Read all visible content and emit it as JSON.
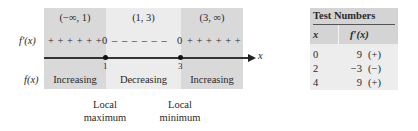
{
  "sign_chart": {
    "intervals": [
      {
        "label": "(−∞, 1)",
        "sign": "+ + + + + +",
        "behavior": "Increasing"
      },
      {
        "label": "(1, 3)",
        "sign": "– – – – – –",
        "behavior": "Decreasing"
      },
      {
        "label": "(3, ∞)",
        "sign": "+ + + + + +",
        "behavior": "Increasing"
      }
    ],
    "row_labels": {
      "derivative": "f′(x)",
      "function": "f(x)"
    },
    "critical_points": [
      {
        "x": "1",
        "zero": "0",
        "extremum_line1": "Local",
        "extremum_line2": "maximum"
      },
      {
        "x": "3",
        "zero": "0",
        "extremum_line1": "Local",
        "extremum_line2": "minimum"
      }
    ],
    "axis_label": "x"
  },
  "test_table": {
    "title": "Test Numbers",
    "headers": [
      "x",
      "f′(x)"
    ],
    "rows": [
      {
        "x": "0",
        "value": "9",
        "sign": "(+)"
      },
      {
        "x": "2",
        "value": "−3",
        "sign": "(−)"
      },
      {
        "x": "4",
        "value": "9",
        "sign": "(+)"
      }
    ]
  },
  "colors": {
    "band_dark": "#d9d9d9",
    "band_light": "#ececec",
    "table_header": "#d4d4d4"
  }
}
